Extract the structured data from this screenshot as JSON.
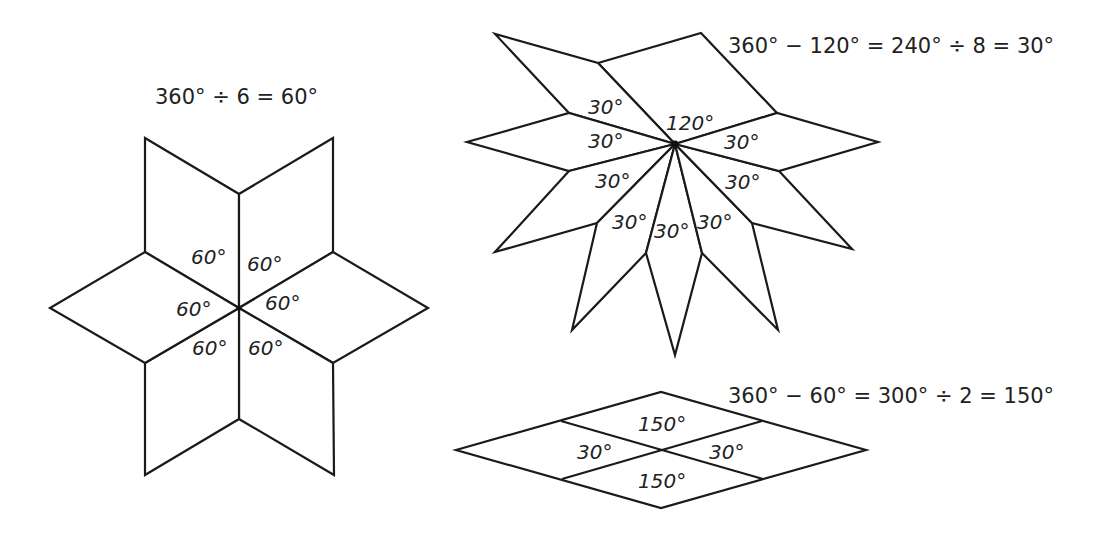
{
  "colors": {
    "line": "#1a1a1a",
    "text": "#222222",
    "background": "#ffffff"
  },
  "six_point_star": {
    "equation": "360° ÷ 6 = 60°",
    "piece_count": 6,
    "angle_labels": [
      "60°",
      "60°",
      "60°",
      "60°",
      "60°",
      "60°"
    ]
  },
  "ten_piece_star": {
    "equation": "360° − 120° = 240° ÷ 8 = 30°",
    "large_angle_label": "120°",
    "small_piece_count": 8,
    "angle_labels": [
      "30°",
      "30°",
      "30°",
      "30°",
      "30°",
      "30°",
      "30°",
      "30°"
    ]
  },
  "split_rhombus": {
    "equation": "360° − 60° = 300° ÷ 2 = 150°",
    "angle_labels": {
      "top": "150°",
      "left": "30°",
      "right": "30°",
      "bottom": "150°"
    }
  }
}
